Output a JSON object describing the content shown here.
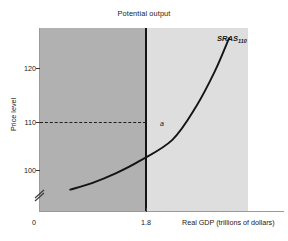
{
  "chart_data": {
    "type": "line",
    "title": "Potential output",
    "xlabel": "Real GDP (trillions of dollars)",
    "ylabel": "Price level",
    "xlim": [
      0.4,
      2.6
    ],
    "ylim": [
      96,
      132
    ],
    "grid": false,
    "legend_position": "inline-curve-end",
    "y_ticks": [
      {
        "value": 120,
        "label": "120"
      },
      {
        "value": 110,
        "label": "110"
      },
      {
        "value": 100,
        "label": "100"
      }
    ],
    "x_ticks": [
      {
        "value": 1.8,
        "label": "1.8"
      }
    ],
    "origin_label": "0",
    "axis_break": "y-axis-break",
    "series": [
      {
        "name": "SRAS",
        "name_subscript": "110",
        "label": "SRAS110",
        "style": "solid-curve",
        "color": "#141414",
        "x": [
          0.72,
          0.95,
          1.2,
          1.45,
          1.8,
          2.05,
          2.25,
          2.4
        ],
        "y": [
          100.2,
          101.5,
          103.4,
          105.8,
          110.0,
          116.5,
          123.5,
          130.0
        ]
      }
    ],
    "reference_lines": [
      {
        "name": "potential-output",
        "orientation": "vertical",
        "value": 1.8,
        "label": "Potential output",
        "style": "solid",
        "color": "#141414"
      },
      {
        "name": "price-level-guide",
        "orientation": "horizontal",
        "value": 110,
        "style": "dashed",
        "color": "#1f1f1f"
      }
    ],
    "annotations": [
      {
        "name": "equilibrium-point",
        "label": "a",
        "x": 1.8,
        "y": 110
      }
    ],
    "shaded_regions": [
      {
        "name": "below-potential",
        "color": "#b1b1b1",
        "x_range": [
          0.4,
          1.8
        ]
      },
      {
        "name": "above-potential",
        "color": "#dedede",
        "x_range": [
          1.8,
          2.6
        ]
      }
    ]
  },
  "colors": {
    "region_left": "#b1b1b1",
    "region_right": "#dedede",
    "curve": "#141414",
    "potential_line": "#141414",
    "axis": "#9a9a9a",
    "text": "#1a1a1a",
    "background": "#ffffff"
  }
}
